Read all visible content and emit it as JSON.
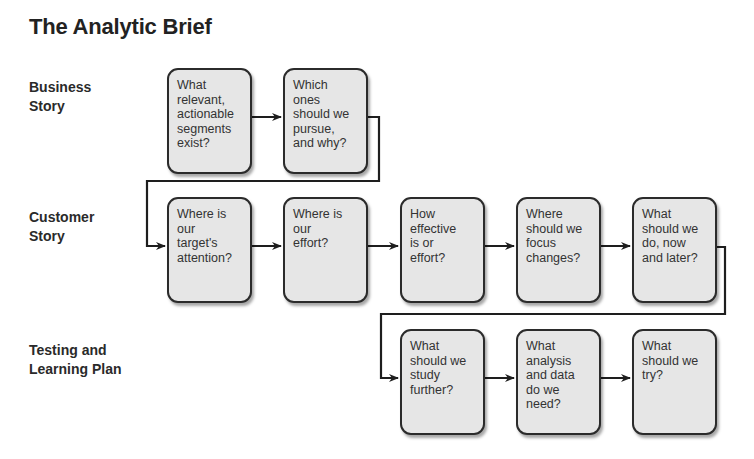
{
  "title": "The Analytic Brief",
  "rows": [
    {
      "label": "Business\nStory",
      "boxes": [
        "What\nrelevant,\nactionable\nsegments\nexist?",
        "Which\nones\nshould we\npursue,\nand why?"
      ]
    },
    {
      "label": "Customer\nStory",
      "boxes": [
        "Where is\nour\ntarget's\nattention?",
        "Where is\nour\neffort?",
        "How\neffective\nis or\neffort?",
        "Where\nshould we\nfocus\nchanges?",
        "What\nshould we\ndo, now\nand later?"
      ]
    },
    {
      "label": "Testing and\nLearning Plan",
      "boxes": [
        "What\nshould we\nstudy\nfurther?",
        "What\nanalysis\nand data\ndo we\nneed?",
        "What\nshould we\ntry?"
      ]
    }
  ],
  "colors": {
    "box_fill": "#e6e6e6",
    "box_border": "#2b2b2b",
    "connector": "#1e1e1e"
  }
}
